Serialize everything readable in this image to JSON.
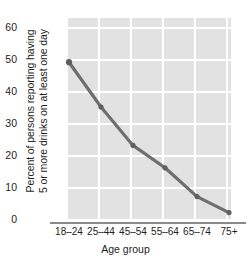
{
  "chart_data": {
    "type": "line",
    "title": "",
    "xlabel": "Age group",
    "ylabel_line1": "Percent of persons reporting having",
    "ylabel_line2": "5 or more drinks on at least one day",
    "categories": [
      "18–24",
      "25–44",
      "45–54",
      "55–64",
      "65–74",
      "75+"
    ],
    "values": [
      49,
      35,
      23,
      16,
      7,
      2
    ],
    "series": [
      {
        "name": "Percent reporting 5+ drinks on at least one day",
        "values": [
          49,
          35,
          23,
          16,
          7,
          2
        ]
      }
    ],
    "yticks": [
      0,
      10,
      20,
      30,
      40,
      50,
      60
    ],
    "ytick_labels": [
      "0",
      "10",
      "20",
      "30",
      "40",
      "50",
      "60"
    ],
    "ylim": [
      0,
      63.5
    ],
    "grid": true,
    "legend": "none",
    "colors": {
      "line": "#6e6e6e",
      "marker": "#5f5f5f",
      "plot_background": "#e2e2e2",
      "gridline": "#ffffff",
      "axis_line": "#8a8a8a",
      "text": "#231f20"
    }
  }
}
